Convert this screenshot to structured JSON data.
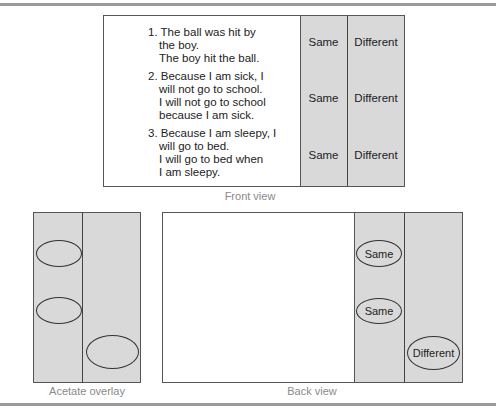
{
  "front_view": {
    "caption": "Front view",
    "items": [
      {
        "number": "1.",
        "lines": [
          "The ball was hit by",
          "the boy.",
          "The boy hit the ball."
        ],
        "choices": [
          "Same",
          "Different"
        ]
      },
      {
        "number": "2.",
        "lines": [
          "Because I am sick, I",
          "will not go to school.",
          "I will not go to school",
          "because I am sick."
        ],
        "choices": [
          "Same",
          "Different"
        ]
      },
      {
        "number": "3.",
        "lines": [
          "Because I am sleepy, I",
          "will go to bed.",
          "I will go to bed when",
          "I am sleepy."
        ],
        "choices": [
          "Same",
          "Different"
        ]
      }
    ]
  },
  "acetate_overlay": {
    "caption": "Acetate overlay",
    "marks": [
      "left",
      "left",
      "right"
    ]
  },
  "back_view": {
    "caption": "Back view",
    "answers": [
      "Same",
      "Same",
      "Different"
    ]
  },
  "colors": {
    "panel_gray": "#d9d9d9",
    "rule_gray": "#9a9a9a",
    "caption_gray": "#8a8a8a"
  }
}
